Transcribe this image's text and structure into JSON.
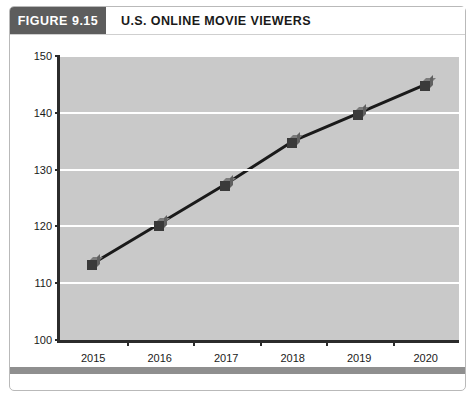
{
  "figure": {
    "badge_label": "FIGURE 9.15",
    "title": "U.S. ONLINE MOVIE VIEWERS"
  },
  "colors": {
    "badge_background": "#5d5d5d",
    "plot_background": "#c9c9c9",
    "gridline": "#ffffff",
    "axis": "#2b2b2b",
    "line": "#1a1a1a",
    "marker_face": "#3a3a3a",
    "marker_top": "#7a7a7a",
    "marker_side": "#606060",
    "footer_bar": "#8f8f8f"
  },
  "chart_data": {
    "type": "line",
    "title": "U.S. ONLINE MOVIE VIEWERS",
    "xlabel": "",
    "ylabel": "",
    "categories": [
      "2015",
      "2016",
      "2017",
      "2018",
      "2019",
      "2020"
    ],
    "values": [
      113.5,
      120.5,
      127.5,
      135,
      140,
      145
    ],
    "ylim": [
      100,
      150
    ],
    "yticks": [
      100,
      110,
      120,
      130,
      140,
      150
    ],
    "ytick_labels": [
      "100",
      "110",
      "120",
      "130",
      "140",
      "150"
    ],
    "grid": true,
    "legend": false,
    "series": [
      {
        "name": "U.S. Online Movie Viewers",
        "values": [
          113.5,
          120.5,
          127.5,
          135,
          140,
          145
        ]
      }
    ]
  }
}
